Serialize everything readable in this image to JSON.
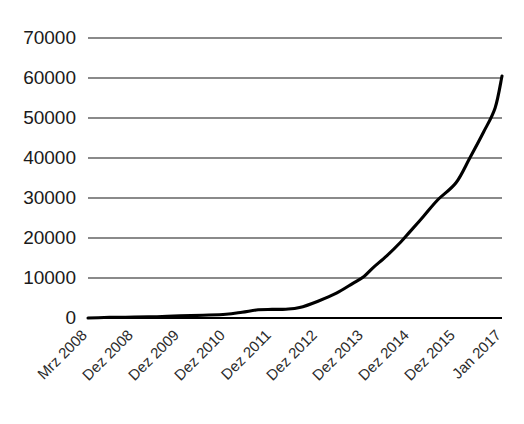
{
  "chart_data": {
    "type": "line",
    "title": "",
    "subtitle": "",
    "xlabel": "",
    "ylabel": "",
    "grid": true,
    "legend": false,
    "legend_position": "none",
    "line_color": "#000000",
    "grid_color": "#8a8a8a",
    "background_color": "#ffffff",
    "ylim": [
      0,
      70000
    ],
    "y_ticks": [
      0,
      10000,
      20000,
      30000,
      40000,
      50000,
      60000,
      70000
    ],
    "y_tick_labels": [
      "0",
      "10000",
      "20000",
      "30000",
      "40000",
      "50000",
      "60000",
      "70000"
    ],
    "categories": [
      "Mrz 2008",
      "Dez 2008",
      "Dez 2009",
      "Dez 2010",
      "Dez 2011",
      "Dez 2012",
      "Dez 2013",
      "Dez 2014",
      "Dez 2015",
      "Jan 2017"
    ],
    "values": [
      0,
      200,
      500,
      900,
      2000,
      4200,
      10500,
      21500,
      33500,
      60500
    ],
    "series": [
      {
        "name": "",
        "values": [
          0,
          200,
          500,
          900,
          2000,
          4200,
          10500,
          21500,
          33500,
          60500
        ]
      }
    ],
    "dense_points": [
      {
        "x": 0.0,
        "y": 0
      },
      {
        "x": 0.35,
        "y": 120
      },
      {
        "x": 0.7,
        "y": 180
      },
      {
        "x": 1.0,
        "y": 220
      },
      {
        "x": 1.5,
        "y": 330
      },
      {
        "x": 2.0,
        "y": 520
      },
      {
        "x": 2.5,
        "y": 700
      },
      {
        "x": 3.0,
        "y": 950
      },
      {
        "x": 3.35,
        "y": 1450
      },
      {
        "x": 3.7,
        "y": 2050
      },
      {
        "x": 4.0,
        "y": 2150
      },
      {
        "x": 4.3,
        "y": 2200
      },
      {
        "x": 4.6,
        "y": 2600
      },
      {
        "x": 5.0,
        "y": 4200
      },
      {
        "x": 5.4,
        "y": 6200
      },
      {
        "x": 5.75,
        "y": 8600
      },
      {
        "x": 6.0,
        "y": 10400
      },
      {
        "x": 6.2,
        "y": 12600
      },
      {
        "x": 6.5,
        "y": 15600
      },
      {
        "x": 6.8,
        "y": 19000
      },
      {
        "x": 7.0,
        "y": 21600
      },
      {
        "x": 7.3,
        "y": 25500
      },
      {
        "x": 7.6,
        "y": 29500
      },
      {
        "x": 8.0,
        "y": 33800
      },
      {
        "x": 8.3,
        "y": 40000
      },
      {
        "x": 8.6,
        "y": 46500
      },
      {
        "x": 8.85,
        "y": 52500
      },
      {
        "x": 9.0,
        "y": 60500
      }
    ]
  }
}
